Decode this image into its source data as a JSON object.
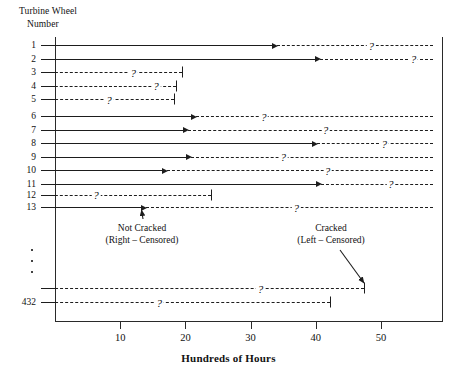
{
  "chart_data": {
    "type": "event-interval",
    "title": "",
    "ylabel_line1": "Turbine Wheel",
    "ylabel_line2": "Number",
    "xlabel": "Hundreds of Hours",
    "xlim": [
      0,
      58
    ],
    "xticks": [
      10,
      20,
      30,
      40,
      50
    ],
    "xticklabels": [
      "10",
      "20",
      "30",
      "40",
      "50"
    ],
    "grid": false,
    "legend": "none",
    "unknown_marker": "?",
    "ellipsis_dots": 3,
    "annotations": [
      {
        "id": "not-cracked",
        "line1": "Not Cracked",
        "line2": "(Right – Censored)",
        "points_to_row": 13
      },
      {
        "id": "cracked",
        "line1": "Cracked",
        "line2": "(Left – Censored)",
        "points_to_row": "431"
      }
    ],
    "rows": [
      {
        "label": "1",
        "type": "right-censored",
        "solid_end": 33.5,
        "dashed_end": 58,
        "q_at": 48.5
      },
      {
        "label": "2",
        "type": "right-censored",
        "solid_end": 40.0,
        "dashed_end": 58,
        "q_at": 55.0
      },
      {
        "label": "3",
        "type": "left-censored",
        "solid_end": 0,
        "dashed_end": 19.5,
        "q_at": 12.0
      },
      {
        "label": "4",
        "type": "left-censored",
        "solid_end": 0,
        "dashed_end": 18.6,
        "q_at": 15.5
      },
      {
        "label": "5",
        "type": "left-censored",
        "solid_end": 0,
        "dashed_end": 18.2,
        "q_at": 8.3
      },
      {
        "label": "6",
        "type": "right-censored",
        "solid_end": 21.0,
        "dashed_end": 58,
        "q_at": 32.0
      },
      {
        "label": "7",
        "type": "right-censored",
        "solid_end": 19.8,
        "dashed_end": 58,
        "q_at": 41.5
      },
      {
        "label": "8",
        "type": "right-censored",
        "solid_end": 39.5,
        "dashed_end": 58,
        "q_at": 50.5
      },
      {
        "label": "9",
        "type": "right-censored",
        "solid_end": 20.3,
        "dashed_end": 58,
        "q_at": 35.0
      },
      {
        "label": "10",
        "type": "right-censored",
        "solid_end": 16.5,
        "dashed_end": 58,
        "q_at": 41.8
      },
      {
        "label": "11",
        "type": "right-censored",
        "solid_end": 40.2,
        "dashed_end": 58,
        "q_at": 51.5
      },
      {
        "label": "12",
        "type": "left-censored",
        "solid_end": 0,
        "dashed_end": 23.9,
        "q_at": 6.3
      },
      {
        "label": "13",
        "type": "right-censored",
        "solid_end": 13.3,
        "dashed_end": 58,
        "q_at": 37.0
      },
      {
        "label": "",
        "type": "left-censored",
        "solid_end": 0,
        "dashed_end": 47.4,
        "q_at": 31.5
      },
      {
        "label": "432",
        "type": "left-censored",
        "solid_end": 0,
        "dashed_end": 42.2,
        "q_at": 16.0
      }
    ]
  }
}
